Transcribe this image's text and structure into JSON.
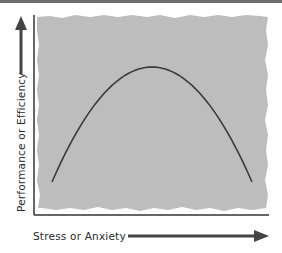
{
  "chart_data": {
    "type": "line",
    "title": "",
    "xlabel": "Stress or Anxiety",
    "ylabel": "Performance or Efficiency",
    "xlim": [
      0,
      1
    ],
    "ylim": [
      0,
      1
    ],
    "grid": false,
    "legend": "none",
    "series": [
      {
        "name": "performance-curve",
        "shape": "inverted-U",
        "x": [
          0.0,
          0.1,
          0.2,
          0.3,
          0.4,
          0.5,
          0.6,
          0.7,
          0.8,
          0.9,
          1.0
        ],
        "y": [
          0.2,
          0.49,
          0.71,
          0.87,
          0.97,
          1.0,
          0.97,
          0.87,
          0.71,
          0.49,
          0.2
        ]
      }
    ],
    "peak": {
      "x": 0.5,
      "y": 1.0
    }
  },
  "colors": {
    "panel": "#bdbdbd",
    "curve": "#3a3a3a",
    "axis": "#333333",
    "arrow": "#444444",
    "top_rule": "#6e6e6e"
  }
}
